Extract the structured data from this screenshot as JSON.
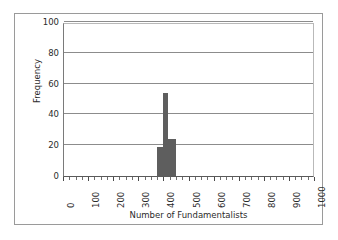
{
  "chart_data": {
    "type": "bar",
    "title": "",
    "subtitle": "",
    "xlabel": "Number of Fundamentalists",
    "ylabel": "Frequency",
    "xlim": [
      0,
      1000
    ],
    "ylim": [
      0,
      100
    ],
    "grid": true,
    "legend": false,
    "legend_position": "none",
    "y_ticks": [
      0,
      20,
      40,
      60,
      80,
      100
    ],
    "y_tick_labels": [
      "0",
      "20",
      "40",
      "60",
      "80",
      "100"
    ],
    "x_ticks": [
      0,
      100,
      200,
      300,
      400,
      500,
      600,
      700,
      800,
      900,
      1000
    ],
    "x_tick_labels": [
      "0",
      "100",
      "200",
      "300",
      "400",
      "500",
      "600",
      "700",
      "800",
      "900",
      "1000"
    ],
    "x_minor_tick_interval": 25,
    "bar_color": "#5e5e5e",
    "bin_width": 25,
    "bins": [
      {
        "x_start": 370,
        "x_end": 395,
        "value": 19
      },
      {
        "x_start": 395,
        "x_end": 415,
        "value": 54
      },
      {
        "x_start": 415,
        "x_end": 445,
        "value": 24
      }
    ],
    "categories": [
      "370-395",
      "395-415",
      "415-445"
    ],
    "values": [
      19,
      54,
      24
    ]
  },
  "axes": {
    "y_title": "Frequency",
    "x_title": "Number of Fundamentalists"
  },
  "colors": {
    "bar": "#5e5e5e",
    "gridline": "#8c8c8c",
    "frame_border": "#9a9a9a",
    "axis": "#5a5a5a",
    "text": "#2b2b2b",
    "background": "#ffffff"
  }
}
